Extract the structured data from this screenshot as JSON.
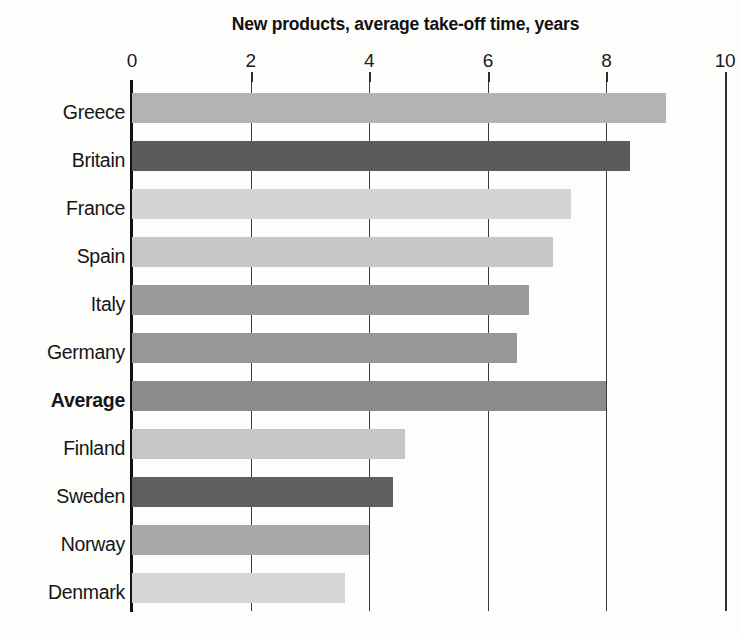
{
  "chart_data": {
    "type": "bar",
    "orientation": "horizontal",
    "title": "New products, average take-off time, years",
    "xlabel": "",
    "ylabel": "",
    "xlim": [
      0,
      10
    ],
    "xticks": [
      0,
      2,
      4,
      6,
      8,
      10
    ],
    "xtick_labels": [
      "0",
      "2",
      "4",
      "6",
      "8",
      "10"
    ],
    "grid": true,
    "legend": "none",
    "categories": [
      "Greece",
      "Britain",
      "France",
      "Spain",
      "Italy",
      "Germany",
      "Average",
      "Finland",
      "Sweden",
      "Norway",
      "Denmark"
    ],
    "values": [
      9.0,
      8.4,
      7.4,
      7.1,
      6.7,
      6.5,
      8.0,
      4.6,
      4.4,
      4.0,
      3.6
    ],
    "bar_colors": [
      "#b3b3b3",
      "#5b5b5b",
      "#d4d4d4",
      "#c7c7c7",
      "#9a9a9a",
      "#979797",
      "#8c8c8c",
      "#c6c6c6",
      "#5e5e5e",
      "#a9a9a9",
      "#d6d6d6"
    ],
    "emphasis_category": "Average",
    "bars": [
      {
        "label": "Greece",
        "value": 9.0,
        "color": "#b3b3b3",
        "bold": false
      },
      {
        "label": "Britain",
        "value": 8.4,
        "color": "#5b5b5b",
        "bold": false
      },
      {
        "label": "France",
        "value": 7.4,
        "color": "#d4d4d4",
        "bold": false
      },
      {
        "label": "Spain",
        "value": 7.1,
        "color": "#c7c7c7",
        "bold": false
      },
      {
        "label": "Italy",
        "value": 6.7,
        "color": "#9a9a9a",
        "bold": false
      },
      {
        "label": "Germany",
        "value": 6.5,
        "color": "#979797",
        "bold": false
      },
      {
        "label": "Average",
        "value": 8.0,
        "color": "#8c8c8c",
        "bold": true
      },
      {
        "label": "Finland",
        "value": 4.6,
        "color": "#c6c6c6",
        "bold": false
      },
      {
        "label": "Sweden",
        "value": 4.4,
        "color": "#5e5e5e",
        "bold": false
      },
      {
        "label": "Norway",
        "value": 4.0,
        "color": "#a9a9a9",
        "bold": false
      },
      {
        "label": "Denmark",
        "value": 3.6,
        "color": "#d6d6d6",
        "bold": false
      }
    ]
  },
  "axis_colors": {
    "axis_line": "#111111",
    "gridline": "#3b3b3b",
    "text": "#151515",
    "background": "#fdfdfc"
  }
}
